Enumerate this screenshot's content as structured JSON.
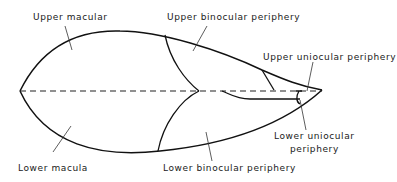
{
  "diagram": {
    "type": "visual field regions",
    "labels": {
      "upper_macular": "Upper macular",
      "upper_binocular": "Upper binocular periphery",
      "upper_uniocular": "Upper uniocular periphery",
      "lower_macula": "Lower macula",
      "lower_binocular": "Lower binocular periphery",
      "lower_uniocular_line1": "Lower uniocular",
      "lower_uniocular_line2": "periphery"
    },
    "colors": {
      "line": "#111111",
      "background": "#ffffff"
    }
  }
}
